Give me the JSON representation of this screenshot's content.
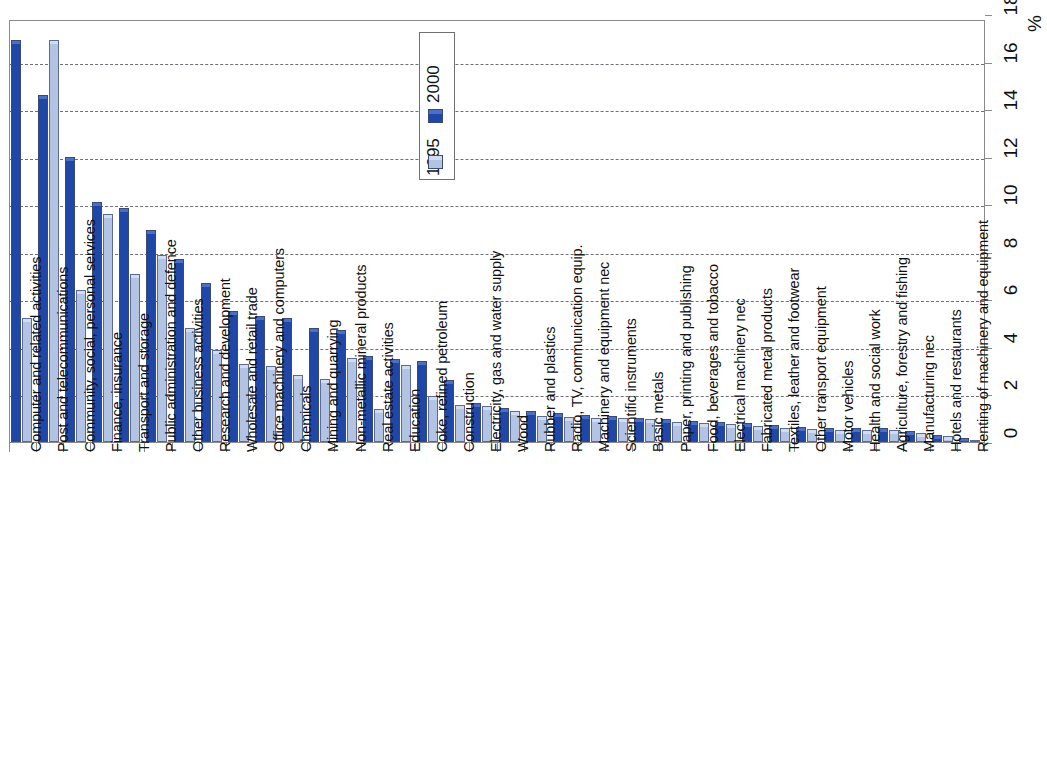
{
  "chart_data": {
    "type": "bar",
    "title": "",
    "subtitle": "",
    "xlabel": "",
    "ylabel": "%",
    "ylim": [
      0,
      18
    ],
    "yticks": [
      0,
      2,
      4,
      6,
      8,
      10,
      12,
      14,
      16,
      18
    ],
    "ytick_labels": [
      "0",
      "2",
      "4",
      "6",
      "8",
      "10",
      "12",
      "14",
      "16",
      "18"
    ],
    "grid": true,
    "axis_position": "right",
    "legend_position": "top-center",
    "orientation": "vertical",
    "legend": [
      "2000",
      "1995"
    ],
    "categories": [
      "Computer and related activities",
      "Post and telecommunications",
      "Community, social, personal services",
      "Finance, insurance",
      "Transport and storage",
      "Public administration and defence",
      "Other business activities",
      "Research and development",
      "Wholesale and retail trade",
      "Office machinery and computers",
      "Chemicals",
      "Mining and quarrying",
      "Non-metallic mineral products",
      "Real estate activities",
      "Education",
      "Coke, refined petroleum",
      "Construction",
      "Electricity, gas and water supply",
      "Wood",
      "Rubber and plastics",
      "Radio, TV, communication equip.",
      "Machinery and equipment nec",
      "Scientific instruments",
      "Basic metals",
      "Paper, printing and publishing",
      "Food, beverages and tobacco",
      "Electrical machinery nec",
      "Fabricated metal products",
      "Textiles, leather and footwear",
      "Other transport equipment",
      "Motor vehicles",
      "Health and social work",
      "Agriculture, forestry and fishing",
      "Manufacturing nec",
      "Hotels and restaurants",
      "Renting of machinery and equipment"
    ],
    "series": [
      {
        "name": "2000",
        "color": "#1f47a8",
        "values": [
          16.9,
          14.6,
          12.0,
          10.1,
          9.85,
          8.9,
          7.7,
          6.7,
          5.5,
          5.3,
          5.2,
          4.8,
          4.7,
          3.6,
          3.5,
          3.4,
          2.6,
          1.65,
          1.45,
          1.3,
          1.2,
          1.15,
          1.1,
          1.0,
          0.95,
          0.9,
          0.85,
          0.8,
          0.72,
          0.65,
          0.6,
          0.6,
          0.58,
          0.45,
          0.3,
          0.18
        ]
      },
      {
        "name": "1995",
        "color": "#b3c3e3",
        "values": [
          5.2,
          16.9,
          6.4,
          9.6,
          7.05,
          7.85,
          4.8,
          3.85,
          3.3,
          3.2,
          2.8,
          2.65,
          3.55,
          1.4,
          3.25,
          1.95,
          1.55,
          1.5,
          1.3,
          1.1,
          1.05,
          1.0,
          1.0,
          0.95,
          0.85,
          0.78,
          0.75,
          0.68,
          0.6,
          0.55,
          0.5,
          0.52,
          0.5,
          0.4,
          0.25,
          0.1
        ]
      }
    ]
  }
}
